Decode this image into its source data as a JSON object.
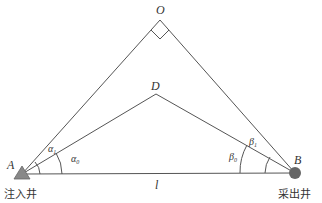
{
  "diagram": {
    "points": {
      "O": {
        "label": "O",
        "x": 160,
        "y": 20
      },
      "D": {
        "label": "D",
        "x": 156,
        "y": 94
      },
      "A": {
        "label": "A",
        "x": 22,
        "y": 174
      },
      "B": {
        "label": "B",
        "x": 295,
        "y": 173
      }
    },
    "segments": [
      {
        "from": "A",
        "to": "O"
      },
      {
        "from": "O",
        "to": "B"
      },
      {
        "from": "A",
        "to": "D"
      },
      {
        "from": "D",
        "to": "B"
      },
      {
        "from": "A",
        "to": "B",
        "label": "l"
      }
    ],
    "angles": {
      "alpha0": {
        "label": "α",
        "sub": "0"
      },
      "alpha1": {
        "label": "α",
        "sub": "1"
      },
      "beta0": {
        "label": "β",
        "sub": "0"
      },
      "beta1": {
        "label": "β",
        "sub": "1"
      }
    },
    "right_angle_at": "O",
    "base_label": "l",
    "wells": {
      "injection": {
        "label": "注入井",
        "marker": "triangle",
        "color": "#888888"
      },
      "production": {
        "label": "采出井",
        "marker": "circle",
        "color": "#666666"
      }
    }
  }
}
